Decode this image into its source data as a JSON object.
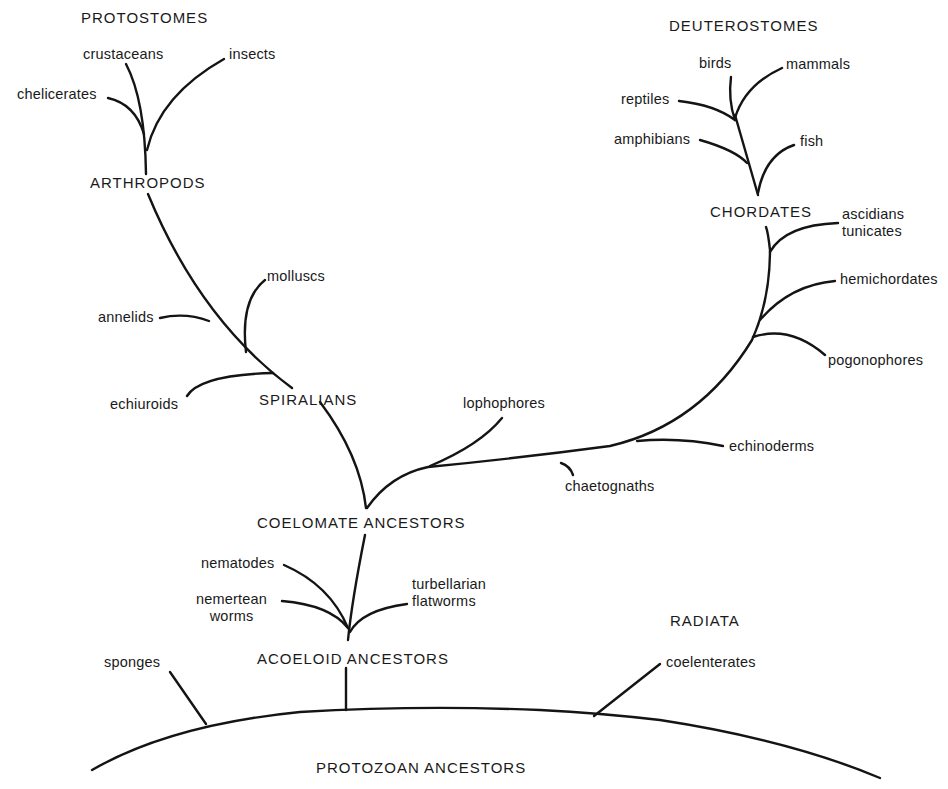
{
  "diagram": {
    "type": "phylogenetic-tree",
    "groups": {
      "protostomes": "PROTOSTOMES",
      "deuterostomes": "DEUTEROSTOMES",
      "radiata": "RADIATA"
    },
    "nodes": {
      "arthropods": "ARTHROPODS",
      "spiralians": "SPIRALIANS",
      "chordates": "CHORDATES",
      "coelomate_ancestors": "COELOMATE ANCESTORS",
      "acoeloid_ancestors": "ACOELOID ANCESTORS",
      "protozoan_ancestors": "PROTOZOAN ANCESTORS"
    },
    "leaves": {
      "crustaceans": "crustaceans",
      "insects": "insects",
      "chelicerates": "chelicerates",
      "molluscs": "molluscs",
      "annelids": "annelids",
      "echiuroids": "echiuroids",
      "lophophores": "lophophores",
      "birds": "birds",
      "mammals": "mammals",
      "reptiles": "reptiles",
      "amphibians": "amphibians",
      "fish": "fish",
      "ascidians": "ascidians",
      "tunicates": "tunicates",
      "hemichordates": "hemichordates",
      "pogonophores": "pogonophores",
      "echinoderms": "echinoderms",
      "chaetognaths": "chaetognaths",
      "nematodes": "nematodes",
      "nemertean": "nemertean",
      "worms": "worms",
      "turbellarian": "turbellarian",
      "flatworms": "flatworms",
      "sponges": "sponges",
      "coelenterates": "coelenterates"
    },
    "edges": [
      [
        "PROTOZOAN ANCESTORS",
        "sponges"
      ],
      [
        "PROTOZOAN ANCESTORS",
        "ACOELOID ANCESTORS"
      ],
      [
        "PROTOZOAN ANCESTORS",
        "coelenterates"
      ],
      [
        "ACOELOID ANCESTORS",
        "nematodes"
      ],
      [
        "ACOELOID ANCESTORS",
        "nemertean worms"
      ],
      [
        "ACOELOID ANCESTORS",
        "turbellarian flatworms"
      ],
      [
        "ACOELOID ANCESTORS",
        "COELOMATE ANCESTORS"
      ],
      [
        "COELOMATE ANCESTORS",
        "SPIRALIANS"
      ],
      [
        "COELOMATE ANCESTORS",
        "lophophores"
      ],
      [
        "COELOMATE ANCESTORS",
        "chaetognaths"
      ],
      [
        "COELOMATE ANCESTORS",
        "echinoderms"
      ],
      [
        "COELOMATE ANCESTORS",
        "pogonophores"
      ],
      [
        "COELOMATE ANCESTORS",
        "hemichordates"
      ],
      [
        "COELOMATE ANCESTORS",
        "ascidians tunicates"
      ],
      [
        "COELOMATE ANCESTORS",
        "CHORDATES"
      ],
      [
        "SPIRALIANS",
        "echiuroids"
      ],
      [
        "SPIRALIANS",
        "molluscs"
      ],
      [
        "SPIRALIANS",
        "annelids"
      ],
      [
        "SPIRALIANS",
        "ARTHROPODS"
      ],
      [
        "ARTHROPODS",
        "chelicerates"
      ],
      [
        "ARTHROPODS",
        "crustaceans"
      ],
      [
        "ARTHROPODS",
        "insects"
      ],
      [
        "CHORDATES",
        "fish"
      ],
      [
        "CHORDATES",
        "amphibians"
      ],
      [
        "CHORDATES",
        "reptiles"
      ],
      [
        "CHORDATES",
        "birds"
      ],
      [
        "CHORDATES",
        "mammals"
      ]
    ],
    "line_color": "#141414",
    "background": "#ffffff"
  }
}
